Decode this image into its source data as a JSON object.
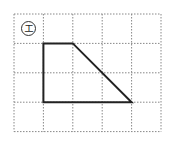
{
  "figure": {
    "label": "エ",
    "grid": {
      "cols": 5,
      "rows": 4,
      "origin": [
        14,
        14
      ],
      "cell": 29.4,
      "line_color": "#888888",
      "line_style": "dotted"
    },
    "shape": {
      "type": "trapezoid",
      "vertices_grid": [
        [
          1,
          1
        ],
        [
          2,
          1
        ],
        [
          4,
          3
        ],
        [
          1,
          3
        ]
      ],
      "stroke": "#222222",
      "stroke_width": 2
    }
  }
}
